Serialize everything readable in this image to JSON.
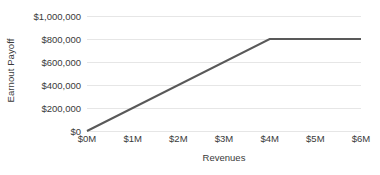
{
  "chart_data": {
    "type": "line",
    "title": "",
    "xlabel": "Revenues",
    "ylabel": "Earnout Payoff",
    "x": [
      0,
      1000000,
      2000000,
      3000000,
      4000000,
      5000000,
      6000000
    ],
    "series": [
      {
        "name": "Earnout Payoff",
        "values": [
          0,
          200000,
          400000,
          600000,
          800000,
          800000,
          800000
        ],
        "color": "#595959"
      }
    ],
    "breakpoints": [
      {
        "x": 0,
        "y": 0
      },
      {
        "x": 4000000,
        "y": 800000
      },
      {
        "x": 6000000,
        "y": 800000
      }
    ],
    "xlim": [
      0,
      6000000
    ],
    "ylim": [
      0,
      1000000
    ],
    "x_tick_labels": [
      "$0M",
      "$1M",
      "$2M",
      "$3M",
      "$4M",
      "$5M",
      "$6M"
    ],
    "x_tick_values": [
      0,
      1000000,
      2000000,
      3000000,
      4000000,
      5000000,
      6000000
    ],
    "y_tick_labels": [
      "$0",
      "$200,000",
      "$400,000",
      "$600,000",
      "$800,000",
      "$1,000,000"
    ],
    "y_tick_values": [
      0,
      200000,
      400000,
      600000,
      800000,
      1000000
    ],
    "grid": true,
    "grid_color": "#e6e6e6",
    "legend": "none",
    "background": "#ffffff",
    "text_color": "#3a3a3a"
  }
}
